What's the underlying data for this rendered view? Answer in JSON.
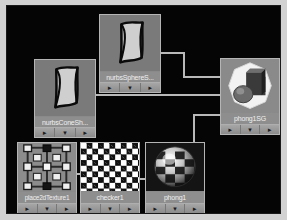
{
  "app": {
    "title": "Hypershade Work Area",
    "canvas_background": "#050505",
    "wire_color": "#b9b9b9",
    "node_body_color": "#9b9b9b",
    "label_text_color": "#f0f0f0"
  },
  "nodes": [
    {
      "id": "nurbsSphereShape",
      "label": "nurbsSphereS...",
      "type": "nurbs-surface",
      "x": 92,
      "y": 8,
      "w": 62,
      "h": 79,
      "buttons": [
        "►",
        "▼",
        "►"
      ],
      "button_names": [
        "input-connections",
        "node-menu",
        "output-connections"
      ]
    },
    {
      "id": "nurbsConeShape",
      "label": "nurbsConeSh...",
      "type": "nurbs-surface",
      "x": 27,
      "y": 53,
      "w": 62,
      "h": 79,
      "buttons": [
        "►",
        "▼",
        "►"
      ],
      "button_names": [
        "input-connections",
        "node-menu",
        "output-connections"
      ]
    },
    {
      "id": "phong1SG",
      "label": "phong1SG",
      "type": "shading-group",
      "x": 213,
      "y": 52,
      "w": 60,
      "h": 77,
      "buttons": [
        "►",
        "▼",
        "►"
      ],
      "button_names": [
        "input-connections",
        "node-menu",
        "output-connections"
      ]
    },
    {
      "id": "place2dTexture1",
      "label": "place2dTexture1",
      "type": "place2d-texture",
      "x": 10,
      "y": 136,
      "w": 60,
      "h": 72,
      "buttons": [
        "►",
        "▼",
        "►"
      ],
      "button_names": [
        "input-connections",
        "node-menu",
        "output-connections"
      ]
    },
    {
      "id": "checker1",
      "label": "checker1",
      "type": "checker-texture",
      "x": 73,
      "y": 136,
      "w": 60,
      "h": 72,
      "buttons": [
        "►",
        "▼",
        "►"
      ],
      "button_names": [
        "input-connections",
        "node-menu",
        "output-connections"
      ]
    },
    {
      "id": "phong1",
      "label": "phong1",
      "type": "phong-material",
      "x": 138,
      "y": 136,
      "w": 60,
      "h": 72,
      "buttons": [
        "►",
        "▼",
        "►"
      ],
      "button_names": [
        "input-connections",
        "node-menu",
        "output-connections"
      ]
    }
  ],
  "connections": [
    {
      "from": "nurbsSphereShape",
      "to": "phong1SG"
    },
    {
      "from": "nurbsConeShape",
      "to": "phong1SG"
    },
    {
      "from": "place2dTexture1",
      "to": "checker1"
    },
    {
      "from": "checker1",
      "to": "phong1"
    },
    {
      "from": "phong1",
      "to": "phong1SG"
    }
  ]
}
